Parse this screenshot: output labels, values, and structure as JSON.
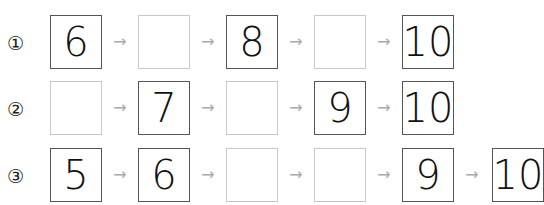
{
  "rows": [
    {
      "label": "①",
      "cells": [
        "6",
        "",
        "8",
        "",
        "10"
      ]
    },
    {
      "label": "②",
      "cells": [
        "",
        "7",
        "",
        "9",
        "10"
      ]
    },
    {
      "label": "③",
      "cells": [
        "5",
        "6",
        "",
        "",
        "9",
        "10"
      ]
    }
  ],
  "arrow": "→"
}
